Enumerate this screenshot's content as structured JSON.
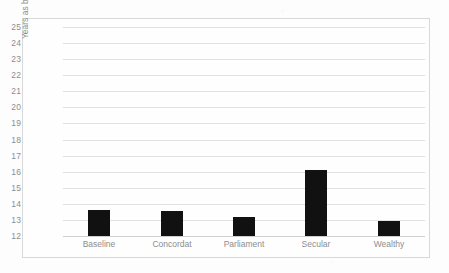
{
  "chart_data": {
    "type": "bar",
    "title": "",
    "xlabel": "",
    "ylabel": "Years as bishop",
    "categories": [
      "Baseline",
      "Concordat",
      "Parliament",
      "Secular",
      "Wealthy"
    ],
    "values": [
      13.6,
      13.55,
      13.2,
      16.1,
      12.95
    ],
    "ylim": [
      12,
      25
    ],
    "ytick_labels": [
      "25",
      "24",
      "23",
      "22",
      "21",
      "20",
      "19",
      "18",
      "17",
      "16",
      "15",
      "14",
      "13",
      "12"
    ],
    "ytick_values": [
      25,
      24,
      23,
      22,
      21,
      20,
      19,
      18,
      17,
      16,
      15,
      14,
      13,
      12
    ],
    "grid": true,
    "legend": "none",
    "bar_color": "#111111",
    "grid_color": "#e2e2e2",
    "axis_text_color": "#8d8d8d",
    "plot_border_color": "#d8d8d8",
    "background_color": "#fdfdfd"
  }
}
